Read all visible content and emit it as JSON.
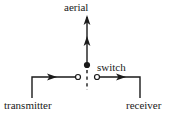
{
  "diagram": {
    "stroke_color": "#1a1a1a",
    "background_color": "#ffffff",
    "labels": {
      "aerial": "aerial",
      "switch": "switch",
      "transmitter": "transmitter",
      "receiver": "receiver"
    },
    "nodes": {
      "switch_contact": "filled-dot",
      "transmitter_terminal": "open-circle",
      "receiver_terminal": "open-circle"
    },
    "lines": {
      "aerial_feed": "solid vertical with two upward arrowheads",
      "switch_blade": "dashed vertical below contact",
      "transmitter_branch": "solid with rightward arrowhead",
      "receiver_branch": "solid with rightward arrowhead"
    }
  }
}
